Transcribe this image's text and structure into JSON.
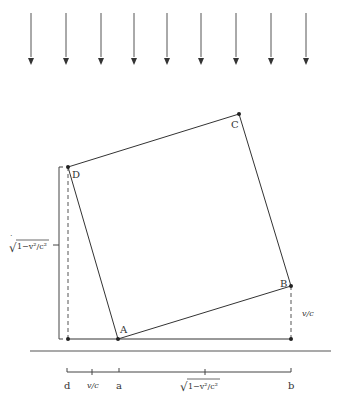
{
  "figure": {
    "colors": {
      "stroke": "#333333",
      "background": "#ffffff"
    },
    "arrows": {
      "count": 9,
      "direction": "down",
      "x_positions": [
        31,
        66,
        101,
        134,
        167,
        201,
        236,
        271,
        306
      ],
      "y_top": 13,
      "y_bottom": 65
    },
    "vertices": {
      "A": {
        "label": "A",
        "x": 118,
        "y": 339
      },
      "B": {
        "label": "B",
        "x": 291,
        "y": 286
      },
      "C": {
        "label": "C",
        "x": 239,
        "y": 114
      },
      "D": {
        "label": "D",
        "x": 68,
        "y": 167
      }
    },
    "left_dimension": {
      "label_sqrt": "√",
      "label_expr": "1−v²/c²",
      "label_full": "√1−v²/c²"
    },
    "right_dimension": {
      "label": "v/c"
    },
    "bottom_axis": {
      "ticks": [
        {
          "label": "d",
          "x": 67
        },
        {
          "label": "v/c",
          "x": 92
        },
        {
          "label": "a",
          "x": 119
        },
        {
          "label": "√1−v²/c²",
          "x": 205
        },
        {
          "label": "b",
          "x": 291
        }
      ]
    }
  }
}
